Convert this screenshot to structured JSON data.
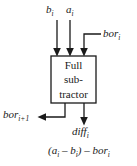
{
  "diagram": {
    "type": "block-diagram",
    "block": {
      "line1": "Full",
      "line2": "sub-",
      "line3": "tractor"
    },
    "inputs": [
      {
        "name": "b",
        "base": "b",
        "sub": "i",
        "label": "b"
      },
      {
        "name": "a",
        "base": "a",
        "sub": "i",
        "label": "a"
      },
      {
        "name": "borrow-in",
        "base": "bor",
        "sub": "i",
        "label": "bor"
      }
    ],
    "outputs": [
      {
        "name": "borrow-out",
        "base": "bor",
        "sub": "i+1",
        "label": "bor"
      },
      {
        "name": "difference",
        "base": "diff",
        "sub": "i",
        "label": "diff"
      }
    ],
    "expression": {
      "text": "(a",
      "sub1": "i",
      "mid": " – b",
      "sub2": "i",
      "tail": ") – bor",
      "sub3": "i"
    },
    "colors": {
      "background": "#ffffff",
      "stroke": "#1a1a1a",
      "text": "#1a1a1a"
    }
  }
}
